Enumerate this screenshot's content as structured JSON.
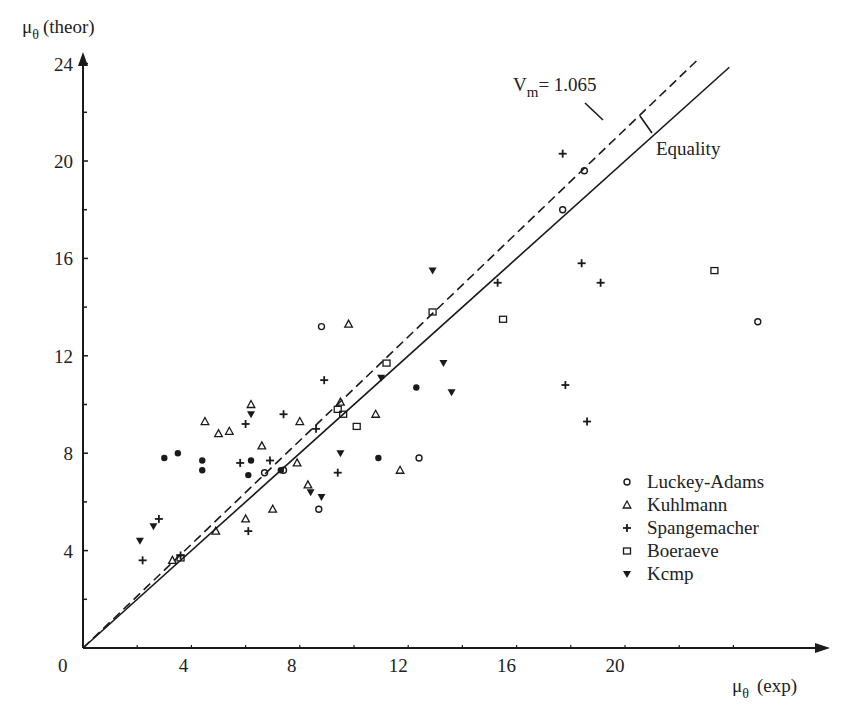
{
  "chart_data": {
    "type": "scatter",
    "title": "",
    "xlabel": "μθ (exp)",
    "ylabel": "μθ (theor)",
    "xlim": [
      0,
      27
    ],
    "ylim": [
      0,
      25
    ],
    "x_ticks": [
      0,
      4,
      8,
      12,
      16,
      20
    ],
    "y_ticks": [
      4,
      8,
      12,
      16,
      20,
      24
    ],
    "x_tick_labels": [
      "0",
      "4",
      "8",
      "12",
      "16",
      "20"
    ],
    "y_tick_labels": [
      "4",
      "8",
      "12",
      "16",
      "20",
      "24"
    ],
    "grid": false,
    "legend_position": "lower right",
    "lines": [
      {
        "name": "Equality",
        "style": "solid",
        "slope": 1.0,
        "label": "Equality"
      },
      {
        "name": "Vm",
        "style": "dashed",
        "slope": 1.065,
        "label": "Vm= 1.065"
      }
    ],
    "series": [
      {
        "name": "Luckey-Adams",
        "marker": "open-circle",
        "points": [
          [
            8.8,
            13.2
          ],
          [
            18.5,
            19.6
          ],
          [
            17.7,
            18.0
          ],
          [
            24.9,
            13.4
          ],
          [
            12.4,
            7.8
          ],
          [
            8.7,
            5.7
          ],
          [
            7.4,
            7.3
          ],
          [
            6.7,
            7.2
          ]
        ]
      },
      {
        "name": "Kuhlmann",
        "marker": "open-triangle",
        "points": [
          [
            4.5,
            9.3
          ],
          [
            5.0,
            8.8
          ],
          [
            5.4,
            8.9
          ],
          [
            6.2,
            10.0
          ],
          [
            6.0,
            5.3
          ],
          [
            4.9,
            4.8
          ],
          [
            3.3,
            3.6
          ],
          [
            7.0,
            5.7
          ],
          [
            7.9,
            7.6
          ],
          [
            8.3,
            6.7
          ],
          [
            9.8,
            13.3
          ],
          [
            10.8,
            9.6
          ],
          [
            11.7,
            7.3
          ],
          [
            6.6,
            8.3
          ],
          [
            8.0,
            9.3
          ],
          [
            9.5,
            10.1
          ]
        ]
      },
      {
        "name": "Spangemacher",
        "marker": "plus",
        "points": [
          [
            2.2,
            3.6
          ],
          [
            2.8,
            5.3
          ],
          [
            3.6,
            3.8
          ],
          [
            6.0,
            9.2
          ],
          [
            7.4,
            9.6
          ],
          [
            6.9,
            7.7
          ],
          [
            5.8,
            7.6
          ],
          [
            6.1,
            4.8
          ],
          [
            8.6,
            9.0
          ],
          [
            8.9,
            11.0
          ],
          [
            9.4,
            7.2
          ],
          [
            15.3,
            15.0
          ],
          [
            18.4,
            15.8
          ],
          [
            19.1,
            15.0
          ],
          [
            17.8,
            10.8
          ],
          [
            18.6,
            9.3
          ],
          [
            17.7,
            20.3
          ]
        ]
      },
      {
        "name": "Boeraeve",
        "marker": "open-square",
        "points": [
          [
            9.4,
            9.8
          ],
          [
            9.6,
            9.6
          ],
          [
            10.1,
            9.1
          ],
          [
            11.2,
            11.7
          ],
          [
            15.5,
            13.5
          ],
          [
            23.3,
            15.5
          ],
          [
            3.6,
            3.7
          ],
          [
            12.9,
            13.8
          ]
        ]
      },
      {
        "name": "Kemp",
        "marker": "filled-triangle-down",
        "points": [
          [
            2.1,
            4.4
          ],
          [
            2.6,
            5.0
          ],
          [
            6.2,
            9.6
          ],
          [
            8.4,
            6.4
          ],
          [
            9.5,
            8.0
          ],
          [
            11.0,
            11.1
          ],
          [
            13.3,
            11.7
          ],
          [
            13.6,
            10.5
          ],
          [
            12.9,
            15.5
          ],
          [
            8.8,
            6.2
          ]
        ]
      },
      {
        "name": "Unlabeled filled circles",
        "marker": "filled-circle",
        "points": [
          [
            3.0,
            7.8
          ],
          [
            3.5,
            8.0
          ],
          [
            4.4,
            7.7
          ],
          [
            4.4,
            7.3
          ],
          [
            6.1,
            7.1
          ],
          [
            6.2,
            7.7
          ],
          [
            7.3,
            7.3
          ],
          [
            10.9,
            7.8
          ],
          [
            12.3,
            10.7
          ]
        ]
      }
    ],
    "annotations": [
      "Vm= 1.065",
      "Equality"
    ]
  },
  "axes": {
    "y_title_main": "μ",
    "y_title_sub": "θ",
    "y_title_rest": "(theor)",
    "x_title_main": "μ",
    "x_title_sub": "θ",
    "x_title_rest": "(exp)",
    "origin_label": "0"
  },
  "annotations": {
    "vm_prefix": "V",
    "vm_sub": "m",
    "vm_value": "= 1.065",
    "equality": "Equality"
  },
  "legend": {
    "items": [
      {
        "label": "Luckey-Adams",
        "marker": "open-circle"
      },
      {
        "label": "Kuhlmann",
        "marker": "open-triangle"
      },
      {
        "label": "Spangemacher",
        "marker": "plus"
      },
      {
        "label": "Boeraeve",
        "marker": "open-square"
      },
      {
        "label": "Kcmp",
        "marker": "filled-triangle-down"
      }
    ]
  },
  "colors": {
    "ink": "#1a1a1a",
    "background": "#ffffff"
  }
}
